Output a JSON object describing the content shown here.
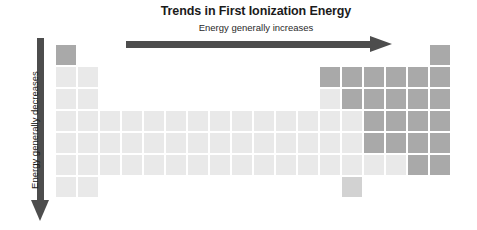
{
  "chart_data": {
    "type": "heatmap",
    "title": "Trends in First Ionization Energy",
    "subtitle": "Energy generally increases",
    "horizontal_trend_label": "Energy generally increases",
    "vertical_trend_label": "Energy generally decreases",
    "xlabel": "",
    "ylabel": "",
    "grid": true,
    "legend_position": "none",
    "colors": {
      "high_energy": "#a9a9a9",
      "low_energy": "#e9e9e9",
      "intermediate": "#d2d2d2",
      "arrow": "#4d4d4d",
      "text": "#1b1b1b",
      "background": "#ffffff"
    },
    "columns": 18,
    "rows": 7,
    "cell_size_px": 20,
    "axis_ranges": {
      "groups": [
        1,
        18
      ],
      "periods": [
        1,
        7
      ]
    },
    "cells": [
      {
        "period": 1,
        "group": 1,
        "shade": "dark"
      },
      {
        "period": 1,
        "group": 18,
        "shade": "dark"
      },
      {
        "period": 2,
        "group": 1,
        "shade": "light"
      },
      {
        "period": 2,
        "group": 2,
        "shade": "light"
      },
      {
        "period": 2,
        "group": 13,
        "shade": "dark"
      },
      {
        "period": 2,
        "group": 14,
        "shade": "dark"
      },
      {
        "period": 2,
        "group": 15,
        "shade": "dark"
      },
      {
        "period": 2,
        "group": 16,
        "shade": "dark"
      },
      {
        "period": 2,
        "group": 17,
        "shade": "dark"
      },
      {
        "period": 2,
        "group": 18,
        "shade": "dark"
      },
      {
        "period": 3,
        "group": 1,
        "shade": "light"
      },
      {
        "period": 3,
        "group": 2,
        "shade": "light"
      },
      {
        "period": 3,
        "group": 13,
        "shade": "light"
      },
      {
        "period": 3,
        "group": 14,
        "shade": "dark"
      },
      {
        "period": 3,
        "group": 15,
        "shade": "dark"
      },
      {
        "period": 3,
        "group": 16,
        "shade": "dark"
      },
      {
        "period": 3,
        "group": 17,
        "shade": "dark"
      },
      {
        "period": 3,
        "group": 18,
        "shade": "dark"
      },
      {
        "period": 4,
        "group": 1,
        "shade": "light"
      },
      {
        "period": 4,
        "group": 2,
        "shade": "light"
      },
      {
        "period": 4,
        "group": 3,
        "shade": "light"
      },
      {
        "period": 4,
        "group": 4,
        "shade": "light"
      },
      {
        "period": 4,
        "group": 5,
        "shade": "light"
      },
      {
        "period": 4,
        "group": 6,
        "shade": "light"
      },
      {
        "period": 4,
        "group": 7,
        "shade": "light"
      },
      {
        "period": 4,
        "group": 8,
        "shade": "light"
      },
      {
        "period": 4,
        "group": 9,
        "shade": "light"
      },
      {
        "period": 4,
        "group": 10,
        "shade": "light"
      },
      {
        "period": 4,
        "group": 11,
        "shade": "light"
      },
      {
        "period": 4,
        "group": 12,
        "shade": "light"
      },
      {
        "period": 4,
        "group": 13,
        "shade": "light"
      },
      {
        "period": 4,
        "group": 14,
        "shade": "light"
      },
      {
        "period": 4,
        "group": 15,
        "shade": "dark"
      },
      {
        "period": 4,
        "group": 16,
        "shade": "dark"
      },
      {
        "period": 4,
        "group": 17,
        "shade": "dark"
      },
      {
        "period": 4,
        "group": 18,
        "shade": "dark"
      },
      {
        "period": 5,
        "group": 1,
        "shade": "light"
      },
      {
        "period": 5,
        "group": 2,
        "shade": "light"
      },
      {
        "period": 5,
        "group": 3,
        "shade": "light"
      },
      {
        "period": 5,
        "group": 4,
        "shade": "light"
      },
      {
        "period": 5,
        "group": 5,
        "shade": "light"
      },
      {
        "period": 5,
        "group": 6,
        "shade": "light"
      },
      {
        "period": 5,
        "group": 7,
        "shade": "light"
      },
      {
        "period": 5,
        "group": 8,
        "shade": "light"
      },
      {
        "period": 5,
        "group": 9,
        "shade": "light"
      },
      {
        "period": 5,
        "group": 10,
        "shade": "light"
      },
      {
        "period": 5,
        "group": 11,
        "shade": "light"
      },
      {
        "period": 5,
        "group": 12,
        "shade": "light"
      },
      {
        "period": 5,
        "group": 13,
        "shade": "light"
      },
      {
        "period": 5,
        "group": 14,
        "shade": "light"
      },
      {
        "period": 5,
        "group": 15,
        "shade": "dark"
      },
      {
        "period": 5,
        "group": 16,
        "shade": "dark"
      },
      {
        "period": 5,
        "group": 17,
        "shade": "dark"
      },
      {
        "period": 5,
        "group": 18,
        "shade": "dark"
      },
      {
        "period": 6,
        "group": 1,
        "shade": "light"
      },
      {
        "period": 6,
        "group": 2,
        "shade": "light"
      },
      {
        "period": 6,
        "group": 3,
        "shade": "light"
      },
      {
        "period": 6,
        "group": 4,
        "shade": "light"
      },
      {
        "period": 6,
        "group": 5,
        "shade": "light"
      },
      {
        "period": 6,
        "group": 6,
        "shade": "light"
      },
      {
        "period": 6,
        "group": 7,
        "shade": "light"
      },
      {
        "period": 6,
        "group": 8,
        "shade": "light"
      },
      {
        "period": 6,
        "group": 9,
        "shade": "light"
      },
      {
        "period": 6,
        "group": 10,
        "shade": "light"
      },
      {
        "period": 6,
        "group": 11,
        "shade": "light"
      },
      {
        "period": 6,
        "group": 12,
        "shade": "light"
      },
      {
        "period": 6,
        "group": 13,
        "shade": "light"
      },
      {
        "period": 6,
        "group": 14,
        "shade": "light"
      },
      {
        "period": 6,
        "group": 15,
        "shade": "light"
      },
      {
        "period": 6,
        "group": 16,
        "shade": "light"
      },
      {
        "period": 6,
        "group": 17,
        "shade": "dark"
      },
      {
        "period": 6,
        "group": 18,
        "shade": "dark"
      },
      {
        "period": 7,
        "group": 1,
        "shade": "light"
      },
      {
        "period": 7,
        "group": 2,
        "shade": "light"
      },
      {
        "period": 7,
        "group": 14,
        "shade": "mid"
      }
    ]
  },
  "figure": {
    "title": "Trends in First Ionization Energy",
    "subtitle": "Energy generally increases",
    "vertical_label": "Energy generally decreases"
  }
}
